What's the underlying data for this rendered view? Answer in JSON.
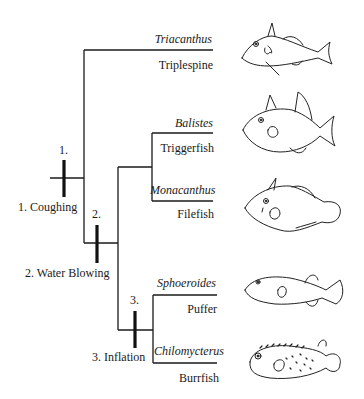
{
  "diagram": {
    "type": "cladogram",
    "colors": {
      "line": "#1a1a1a",
      "background": "#ffffff"
    },
    "taxa": [
      {
        "genus": "Triacanthus",
        "common": "Triplespine",
        "icon": "triplespine-fish-icon"
      },
      {
        "genus": "Balistes",
        "common": "Triggerfish",
        "icon": "triggerfish-icon"
      },
      {
        "genus": "Monacanthus",
        "common": "Filefish",
        "icon": "filefish-icon"
      },
      {
        "genus": "Sphoeroides",
        "common": "Puffer",
        "icon": "puffer-fish-icon"
      },
      {
        "genus": "Chilomycterus",
        "common": "Burrfish",
        "icon": "burrfish-icon"
      }
    ],
    "characters": [
      {
        "number": "1.",
        "label": "1. Coughing"
      },
      {
        "number": "2.",
        "label": "2. Water Blowing"
      },
      {
        "number": "3.",
        "label": "3. Inflation"
      }
    ]
  }
}
